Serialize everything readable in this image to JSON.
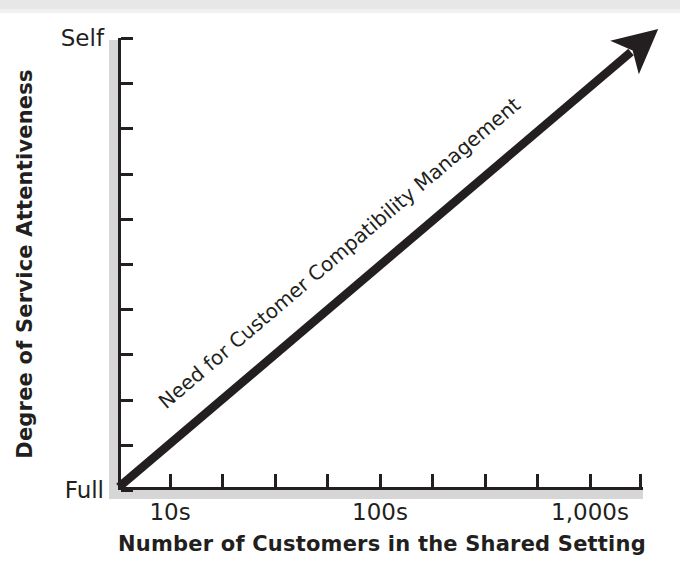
{
  "chart_data": {
    "type": "line",
    "title": "",
    "subtitle": "",
    "xlabel": "Number of Customers in the Shared Setting",
    "ylabel": "Degree of Service Attentiveness",
    "grid": false,
    "legend": "none",
    "x_tick_labels": [
      "10s",
      "100s",
      "1,000s"
    ],
    "y_tick_labels": [
      "Self",
      "Full"
    ],
    "y_axis_direction": "Full at bottom, Self at top",
    "x_tick_count": 9,
    "y_tick_count": 10,
    "series": [
      {
        "name": "Need for Customer Compatibility Management",
        "style": "thick straight arrow with solid arrowhead",
        "x": [
          "10s",
          "1,000s"
        ],
        "values": [
          "Full",
          "Self"
        ],
        "points": [
          [
            0,
            0
          ],
          [
            100,
            100
          ]
        ]
      }
    ],
    "annotations": [
      {
        "text": "Need for Customer Compatibility Management",
        "placement": "along-arrow",
        "rotation_deg": -40.4
      }
    ],
    "colors": {
      "line": "#231f20",
      "axis": "#231f20",
      "axis_shadow": "#d6d6d6",
      "background": "#ffffff"
    }
  },
  "axes": {
    "y": {
      "title": "Degree of Service Attentiveness",
      "top_label": "Self",
      "bottom_label": "Full",
      "ticks": [
        {
          "label": "Self",
          "pos_pct": 0
        },
        {
          "label": "",
          "pos_pct": 10
        },
        {
          "label": "",
          "pos_pct": 20
        },
        {
          "label": "",
          "pos_pct": 30
        },
        {
          "label": "",
          "pos_pct": 40
        },
        {
          "label": "",
          "pos_pct": 50
        },
        {
          "label": "",
          "pos_pct": 60
        },
        {
          "label": "",
          "pos_pct": 70
        },
        {
          "label": "",
          "pos_pct": 80
        },
        {
          "label": "",
          "pos_pct": 90
        },
        {
          "label": "Full",
          "pos_pct": 100
        }
      ]
    },
    "x": {
      "title": "Number of Customers in the Shared Setting",
      "ticks": [
        {
          "label": "10s",
          "pos_px": 52
        },
        {
          "label": "",
          "pos_px": 104
        },
        {
          "label": "",
          "pos_px": 157
        },
        {
          "label": "",
          "pos_px": 209
        },
        {
          "label": "100s",
          "pos_px": 262
        },
        {
          "label": "",
          "pos_px": 314
        },
        {
          "label": "",
          "pos_px": 367
        },
        {
          "label": "",
          "pos_px": 419
        },
        {
          "label": "1,000s",
          "pos_px": 472
        },
        {
          "label": "",
          "pos_px": 522
        }
      ]
    }
  },
  "trend": {
    "label": "Need for Customer Compatibility Management"
  }
}
